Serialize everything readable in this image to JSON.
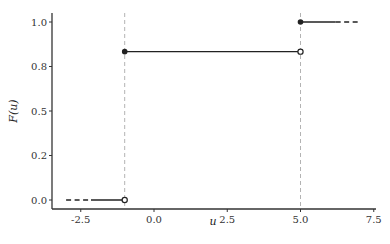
{
  "chart_data": {
    "type": "line",
    "subtype": "step-cdf",
    "title": "",
    "xlabel": "u",
    "ylabel": "F(u)",
    "xlim": [
      -3.5,
      7.6
    ],
    "ylim": [
      -0.03,
      1.05
    ],
    "x_ticks": [
      -2.5,
      0.0,
      2.5,
      5.0,
      7.5
    ],
    "x_tick_labels": [
      "-2.5",
      "0.0",
      "2.5",
      "5.0",
      "7.5"
    ],
    "y_ticks": [
      0.0,
      0.25,
      0.5,
      0.75,
      1.0
    ],
    "y_tick_labels": [
      "0.0",
      "0.2",
      "0.5",
      "0.8",
      "1.0"
    ],
    "grid": false,
    "legend": null,
    "steps": [
      {
        "x_start": -3.0,
        "x_end": -1.0,
        "y": 0.0,
        "dashed_from": -3.0,
        "dashed_to": -2.15,
        "start_point": "none",
        "end_point": "open"
      },
      {
        "x_start": -1.0,
        "x_end": 5.0,
        "y": 0.8333,
        "start_point": "closed",
        "end_point": "open"
      },
      {
        "x_start": 5.0,
        "x_end": 7.0,
        "y": 1.0,
        "dashed_from": 6.2,
        "dashed_to": 7.0,
        "start_point": "closed",
        "end_point": "none"
      }
    ],
    "jump_points": [
      -1.0,
      5.0
    ],
    "vertical_reference_lines": [
      {
        "x": -1.0,
        "style": "dashed",
        "color": "#b3b3b3"
      },
      {
        "x": 5.0,
        "style": "dashed",
        "color": "#b3b3b3"
      }
    ],
    "colors": {
      "line": "#222222",
      "reference": "#b8b8b8",
      "axis": "#333333"
    }
  }
}
